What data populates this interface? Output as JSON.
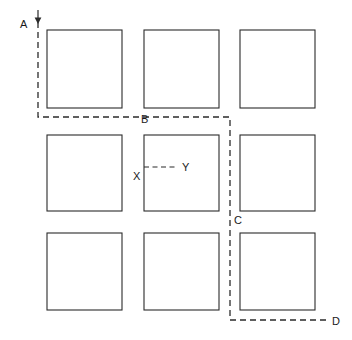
{
  "diagram": {
    "background_color": "#ffffff",
    "line_color": "#2b2b2b",
    "label_color": "#1a1a1a",
    "grid": {
      "rows": 3,
      "cols": 3,
      "cell_count": 9,
      "cells": [
        {
          "id": "r1c1",
          "x": 47,
          "y": 30,
          "w": 75,
          "h": 78
        },
        {
          "id": "r1c2",
          "x": 144,
          "y": 30,
          "w": 75,
          "h": 78
        },
        {
          "id": "r1c3",
          "x": 240,
          "y": 30,
          "w": 75,
          "h": 78
        },
        {
          "id": "r2c1",
          "x": 47,
          "y": 135,
          "w": 75,
          "h": 76
        },
        {
          "id": "r2c2",
          "x": 144,
          "y": 135,
          "w": 75,
          "h": 76
        },
        {
          "id": "r2c3",
          "x": 240,
          "y": 135,
          "w": 75,
          "h": 76
        },
        {
          "id": "r3c1",
          "x": 47,
          "y": 233,
          "w": 75,
          "h": 77
        },
        {
          "id": "r3c2",
          "x": 144,
          "y": 233,
          "w": 75,
          "h": 77
        },
        {
          "id": "r3c3",
          "x": 240,
          "y": 233,
          "w": 75,
          "h": 77
        }
      ]
    },
    "main_path": {
      "style": "dashed",
      "points": "38,22 38,117 230,117 230,218 230,320 326,320",
      "segments": [
        {
          "from": "A",
          "to": "B",
          "orientation": "vertical-then-horizontal"
        },
        {
          "from": "B",
          "to": "C",
          "orientation": "vertical-then-horizontal"
        },
        {
          "from": "C",
          "to": "D",
          "orientation": "vertical-then-horizontal"
        }
      ]
    },
    "detail_path": {
      "style": "dashed",
      "points": "144,167 178,167",
      "from": "X",
      "to": "Y"
    },
    "arrow": {
      "name": "down-arrow",
      "x": 38,
      "tip_y": 24,
      "tail_y": 10,
      "direction": "down"
    },
    "labels": [
      {
        "id": "A",
        "text": "A",
        "x": 20,
        "y": 28,
        "anchor": "start"
      },
      {
        "id": "B",
        "text": "B",
        "x": 141,
        "y": 123,
        "anchor": "start"
      },
      {
        "id": "X",
        "text": "X",
        "x": 133,
        "y": 180,
        "anchor": "start"
      },
      {
        "id": "Y",
        "text": "Y",
        "x": 182,
        "y": 171,
        "anchor": "start"
      },
      {
        "id": "C",
        "text": "C",
        "x": 234,
        "y": 224,
        "anchor": "start"
      },
      {
        "id": "D",
        "text": "D",
        "x": 332,
        "y": 325,
        "anchor": "start"
      }
    ]
  }
}
